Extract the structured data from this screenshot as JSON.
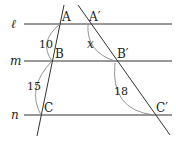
{
  "diagram": {
    "lines": {
      "l": {
        "label": "ℓ",
        "y": 24
      },
      "m": {
        "label": "m",
        "y": 61
      },
      "n": {
        "label": "n",
        "y": 115
      }
    },
    "points": {
      "A": "A",
      "B": "B",
      "C": "C",
      "A_prime": "A′",
      "B_prime": "B′",
      "C_prime": "C′"
    },
    "segment_lengths": {
      "AB": "10",
      "BC": "15",
      "A_prime_B_prime": "x",
      "B_prime_C_prime": "18"
    },
    "colors": {
      "stroke": "#333333",
      "arc": "#888888",
      "text": "#222222"
    }
  }
}
